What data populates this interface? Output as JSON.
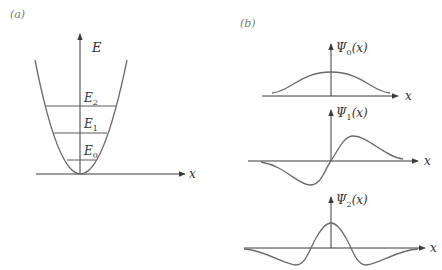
{
  "panel_a": {
    "label": "(a)",
    "y_axis_label": "E",
    "x_axis_label": "x",
    "levels": [
      {
        "symbol": "E",
        "subscript": "0"
      },
      {
        "symbol": "E",
        "subscript": "1"
      },
      {
        "symbol": "E",
        "subscript": "2"
      }
    ]
  },
  "panel_b": {
    "label": "(b)",
    "plots": [
      {
        "symbol": "Ψ",
        "subscript": "0",
        "arg": "(x)",
        "x_label": "x"
      },
      {
        "symbol": "Ψ",
        "subscript": "1",
        "arg": "(x)",
        "x_label": "x"
      },
      {
        "symbol": "Ψ",
        "subscript": "2",
        "arg": "(x)",
        "x_label": "x"
      }
    ]
  },
  "colors": {
    "axis": "#3a3a3a",
    "curve": "#6a6a6a",
    "text": "#333333"
  }
}
